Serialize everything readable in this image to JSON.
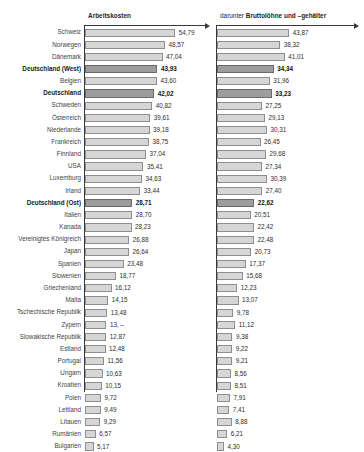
{
  "headers": {
    "left": "Arbeitskosten",
    "right_prefix": "darunter ",
    "right_bold": "Bruttolöhne und –gehälter"
  },
  "chart_data": {
    "type": "bar",
    "xlabel": "",
    "ylabel": "",
    "orientation": "horizontal",
    "grid": false,
    "legend": "none",
    "categories": [
      "Schweiz",
      "Norwegen",
      "Dänemark",
      "Deutschland (West)",
      "Belgien",
      "Deutschland",
      "Schweden",
      "Österreich",
      "Niederlande",
      "Frankreich",
      "Finnland",
      "USA",
      "Luxemburg",
      "Irland",
      "Deutschland (Ost)",
      "Italien",
      "Kanada",
      "Vereinigtes Königreich",
      "Japan",
      "Spanien",
      "Slowenien",
      "Griechenland",
      "Malta",
      "Tschechische Republik",
      "Zypern",
      "Slowakische Republik",
      "Estland",
      "Portugal",
      "Ungarn",
      "Kroatien",
      "Polen",
      "Lettland",
      "Litauen",
      "Rumänien",
      "Bulgarien"
    ],
    "highlight_categories": [
      "Deutschland (West)",
      "Deutschland",
      "Deutschland (Ost)"
    ],
    "series": [
      {
        "name": "Arbeitskosten",
        "values": [
          54.79,
          48.57,
          47.04,
          43.93,
          43.6,
          42.02,
          40.82,
          39.61,
          39.18,
          38.75,
          37.04,
          35.41,
          34.63,
          33.44,
          28.71,
          28.7,
          28.23,
          26.88,
          26.64,
          23.48,
          18.77,
          16.12,
          14.15,
          13.48,
          13.0,
          12.87,
          12.48,
          11.56,
          10.63,
          10.15,
          9.72,
          9.49,
          9.29,
          6.57,
          5.17
        ],
        "labels": [
          "54,79",
          "48,57",
          "47,04",
          "43,93",
          "43,60",
          "42,02",
          "40,82",
          "39,61",
          "39,18",
          "38,75",
          "37,04",
          "35,41",
          "34,63",
          "33,44",
          "28,71",
          "28,70",
          "28,23",
          "26,88",
          "26,64",
          "23,48",
          "18,77",
          "16,12",
          "14,15",
          "13,48",
          "13, –",
          "12,87",
          "12,48",
          "11,56",
          "10,63",
          "10,15",
          "9,72",
          "9,49",
          "9,29",
          "6,57",
          "5,17"
        ],
        "axis_max": 57
      },
      {
        "name": "darunter Bruttolöhne und –gehälter",
        "values": [
          43.87,
          38.32,
          41.01,
          34.34,
          31.96,
          33.23,
          27.25,
          29.13,
          30.31,
          26.45,
          29.68,
          27.34,
          30.39,
          27.4,
          22.62,
          20.51,
          22.42,
          22.48,
          20.73,
          17.37,
          15.68,
          12.23,
          13.07,
          9.78,
          11.12,
          9.38,
          9.22,
          9.21,
          8.56,
          8.51,
          7.91,
          7.41,
          8.88,
          6.21,
          4.3
        ],
        "labels": [
          "43,87",
          "38,32",
          "41,01",
          "34,34",
          "31,96",
          "33,23",
          "27,25",
          "29,13",
          "30,31",
          "26,45",
          "29,68",
          "27,34",
          "30,39",
          "27,40",
          "22,62",
          "20,51",
          "22,42",
          "22,48",
          "20,73",
          "17,37",
          "15,68",
          "12,23",
          "13,07",
          "9,78",
          "11,12",
          "9,38",
          "9,22",
          "9,21",
          "8,56",
          "8,51",
          "7,91",
          "7,41",
          "8,88",
          "6,21",
          "4,30"
        ],
        "axis_max": 57
      }
    ],
    "colors": {
      "bar_fill": "#d6d6d6",
      "bar_border": "#8e8e8e",
      "highlight_fill": "#9d9d9d",
      "highlight_border": "#6a6a6a",
      "axis": "#3a3a3a",
      "text": "#2e2e2e"
    }
  }
}
